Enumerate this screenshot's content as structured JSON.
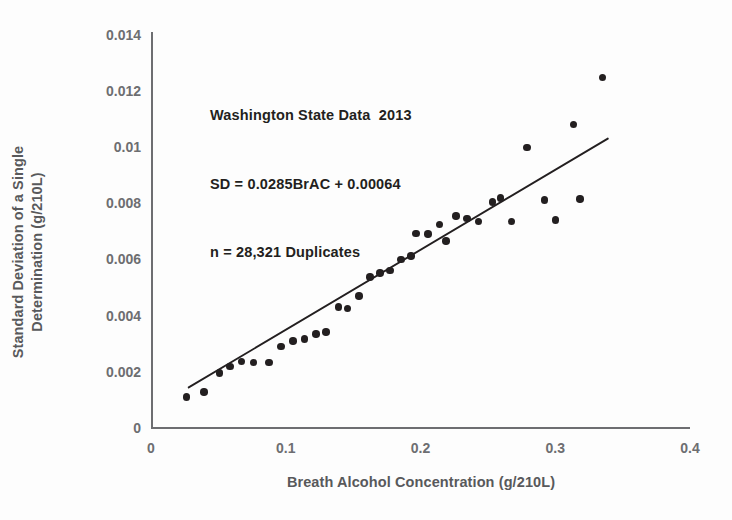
{
  "chart_data": {
    "type": "scatter",
    "title": "",
    "xlabel": "Breath Alcohol Concentration (g/210L)",
    "ylabel": "Standard Deviation of a Single Determination (g/210L)",
    "ylabel_line1": "Standard Deviation of a Single",
    "ylabel_line2": "Determination (g/210L)",
    "xlim": [
      0,
      0.4
    ],
    "ylim": [
      0,
      0.014
    ],
    "xticks": [
      0,
      0.1,
      0.2,
      0.3,
      0.4
    ],
    "xtick_labels": [
      "0",
      "0.1",
      "0.2",
      "0.3",
      "0.4"
    ],
    "yticks": [
      0,
      0.002,
      0.004,
      0.006,
      0.008,
      0.01,
      0.012,
      0.014
    ],
    "ytick_labels": [
      "0",
      "0.002",
      "0.004",
      "0.006",
      "0.008",
      "0.01",
      "0.012",
      "0.014"
    ],
    "grid": false,
    "legend": false,
    "marker_color": "#231f20",
    "line_color": "#231f20",
    "axis_color": "#6d6e71",
    "annotations": [
      "Washington State Data  2013",
      "SD = 0.0285BrAC + 0.00064",
      "n = 28,321 Duplicates"
    ],
    "fit": {
      "equation": "SD = 0.0285BrAC + 0.00064",
      "slope": 0.0285,
      "intercept": 0.00064,
      "x_start": 0.028,
      "x_end": 0.339
    },
    "n_duplicates": "28,321",
    "data_year": "2013",
    "region": "Washington State",
    "points": [
      {
        "x": 0.0265,
        "y": 0.0011
      },
      {
        "x": 0.0395,
        "y": 0.00128
      },
      {
        "x": 0.051,
        "y": 0.00195
      },
      {
        "x": 0.0585,
        "y": 0.00219
      },
      {
        "x": 0.067,
        "y": 0.00236
      },
      {
        "x": 0.076,
        "y": 0.00233
      },
      {
        "x": 0.0875,
        "y": 0.00233
      },
      {
        "x": 0.0965,
        "y": 0.0029
      },
      {
        "x": 0.1055,
        "y": 0.0031
      },
      {
        "x": 0.114,
        "y": 0.00316
      },
      {
        "x": 0.1225,
        "y": 0.00335
      },
      {
        "x": 0.13,
        "y": 0.00342
      },
      {
        "x": 0.139,
        "y": 0.0043
      },
      {
        "x": 0.146,
        "y": 0.00425
      },
      {
        "x": 0.1545,
        "y": 0.0047
      },
      {
        "x": 0.1625,
        "y": 0.00538
      },
      {
        "x": 0.17,
        "y": 0.00552
      },
      {
        "x": 0.1775,
        "y": 0.0056
      },
      {
        "x": 0.1855,
        "y": 0.006
      },
      {
        "x": 0.193,
        "y": 0.00612
      },
      {
        "x": 0.1965,
        "y": 0.00693
      },
      {
        "x": 0.2055,
        "y": 0.0069
      },
      {
        "x": 0.214,
        "y": 0.00725
      },
      {
        "x": 0.219,
        "y": 0.00665
      },
      {
        "x": 0.2265,
        "y": 0.00755
      },
      {
        "x": 0.2345,
        "y": 0.00745
      },
      {
        "x": 0.243,
        "y": 0.00735
      },
      {
        "x": 0.2535,
        "y": 0.00805
      },
      {
        "x": 0.2595,
        "y": 0.00818
      },
      {
        "x": 0.2675,
        "y": 0.00735
      },
      {
        "x": 0.279,
        "y": 0.00998
      },
      {
        "x": 0.292,
        "y": 0.00812
      },
      {
        "x": 0.3,
        "y": 0.0074
      },
      {
        "x": 0.3135,
        "y": 0.0108
      },
      {
        "x": 0.3185,
        "y": 0.00815
      },
      {
        "x": 0.335,
        "y": 0.01248
      }
    ]
  }
}
